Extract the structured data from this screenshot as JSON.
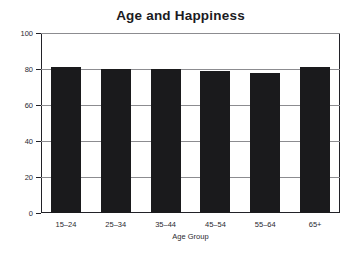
{
  "chart_data": {
    "type": "bar",
    "title": "Age and Happiness",
    "xlabel": "Age Group",
    "ylabel": "",
    "categories": [
      "15–24",
      "25–34",
      "35–44",
      "45–54",
      "55–64",
      "65+"
    ],
    "values": [
      81,
      80,
      80,
      79,
      78,
      81
    ],
    "ylim": [
      0,
      100
    ],
    "yticks": [
      0,
      20,
      40,
      60,
      80,
      100
    ],
    "ytick_labels": [
      "0",
      "20",
      "40",
      "60",
      "80",
      "100"
    ],
    "grid": true,
    "grid_axis": "y",
    "legend": null,
    "bar_color": "#1a1a1c",
    "grid_color": "#8c8c90",
    "axis_color": "#222228",
    "background_color": "#ffffff",
    "title_color": "#1b1b22"
  }
}
